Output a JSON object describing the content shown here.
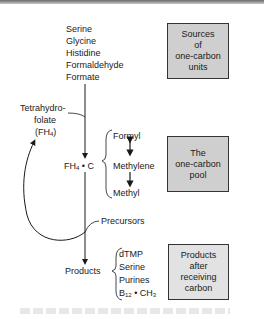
{
  "sources": {
    "items": [
      "Serine",
      "Glycine",
      "Histidine",
      "Formaldehyde",
      "Formate"
    ],
    "box_label": "Sources\nof\none-carbon\nunits"
  },
  "folate": {
    "line1": "Tetrahydro-",
    "line2": "folate",
    "line3_prefix": "(FH",
    "line3_sub": "4",
    "line3_suffix": ")"
  },
  "pool": {
    "center_prefix": "FH",
    "center_sub": "4",
    "center_suffix": " • C",
    "forms": [
      "Formyl",
      "Methylene",
      "Methyl"
    ],
    "box_label": "The\none-carbon\npool"
  },
  "precursors_label": "Precursors",
  "products": {
    "label": "Products",
    "items": [
      "dTMP",
      "Serine",
      "Purines"
    ],
    "b12_prefix": "B",
    "b12_sub": "12",
    "b12_suffix": " • CH",
    "ch3_sub": "3",
    "box_label": "Products\nafter\nreceiving\ncarbon"
  },
  "colors": {
    "box_dark_fill": "#cfcfcf",
    "box_light_fill": "#e2e2e2",
    "line": "#1a1a1a"
  }
}
